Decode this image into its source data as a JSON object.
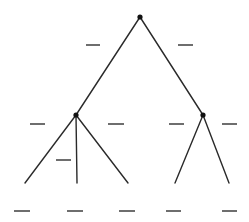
{
  "diagram": {
    "type": "tree",
    "line_color": "#2a2a2a",
    "blank_color": "#4a4a4a",
    "nodes": [
      {
        "id": "root",
        "x": 140,
        "y": 17
      },
      {
        "id": "left",
        "x": 76,
        "y": 115
      },
      {
        "id": "right",
        "x": 203,
        "y": 115
      }
    ],
    "edges": [
      {
        "from": [
          140,
          17
        ],
        "to": [
          76,
          115
        ]
      },
      {
        "from": [
          140,
          17
        ],
        "to": [
          203,
          115
        ]
      },
      {
        "from": [
          76,
          115
        ],
        "to": [
          25,
          183
        ]
      },
      {
        "from": [
          76,
          115
        ],
        "to": [
          77,
          183
        ]
      },
      {
        "from": [
          76,
          115
        ],
        "to": [
          128,
          183
        ]
      },
      {
        "from": [
          203,
          115
        ],
        "to": [
          175,
          183
        ]
      },
      {
        "from": [
          203,
          115
        ],
        "to": [
          229,
          183
        ]
      }
    ],
    "blanks": [
      {
        "x1": 86,
        "x2": 100,
        "y": 45
      },
      {
        "x1": 178,
        "x2": 193,
        "y": 45
      },
      {
        "x1": 30,
        "x2": 45,
        "y": 124
      },
      {
        "x1": 108,
        "x2": 124,
        "y": 124
      },
      {
        "x1": 56,
        "x2": 71,
        "y": 160
      },
      {
        "x1": 169,
        "x2": 184,
        "y": 124
      },
      {
        "x1": 222,
        "x2": 237,
        "y": 124
      },
      {
        "x1": 14,
        "x2": 30,
        "y": 211
      },
      {
        "x1": 67,
        "x2": 83,
        "y": 211
      },
      {
        "x1": 119,
        "x2": 135,
        "y": 211
      },
      {
        "x1": 166,
        "x2": 181,
        "y": 211
      },
      {
        "x1": 222,
        "x2": 237,
        "y": 211
      }
    ]
  }
}
